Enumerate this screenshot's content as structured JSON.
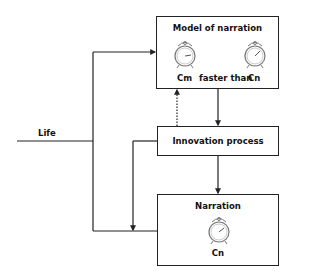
{
  "diagram": {
    "input": {
      "label": "Life"
    },
    "model_box": {
      "title": "Model of narration",
      "left_clock_label": "Cm",
      "relation": "faster than",
      "right_clock_label": "Cn",
      "icons": [
        "alarm-clock-icon",
        "alarm-clock-icon"
      ]
    },
    "innovation_box": {
      "title": "Innovation process"
    },
    "narration_box": {
      "title": "Narration",
      "clock_label": "Cn",
      "icons": [
        "alarm-clock-icon"
      ]
    },
    "edges": [
      {
        "from": "Life",
        "to": "Model of narration",
        "style": "solid"
      },
      {
        "from": "Life",
        "to": "Narration",
        "style": "solid"
      },
      {
        "from": "Model of narration",
        "to": "Innovation process",
        "style": "solid"
      },
      {
        "from": "Innovation process",
        "to": "Model of narration",
        "style": "dotted"
      },
      {
        "from": "Innovation process",
        "to": "Narration",
        "style": "solid"
      },
      {
        "from": "Innovation process",
        "to": "Life-Narration line",
        "style": "solid"
      }
    ],
    "colors": {
      "line": "#222222",
      "background": "#ffffff"
    }
  }
}
